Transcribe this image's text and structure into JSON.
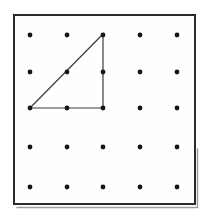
{
  "figure": {
    "type": "geoboard-diagram",
    "background_color": "#ffffff",
    "board": {
      "x": 14,
      "y": 15,
      "width": 181,
      "height": 189,
      "fill": "#fefefe",
      "border_color": "#2b2b2b",
      "border_width": 2,
      "shadow_color": "#9e9e9e",
      "shadow_width": 1.5
    },
    "grid": {
      "rows": 5,
      "cols": 5,
      "col_x": [
        30,
        67,
        103,
        140,
        177
      ],
      "row_y": [
        35,
        72,
        108,
        147,
        187
      ],
      "dot_radius": 2.4,
      "dot_color": "#161616"
    },
    "triangle": {
      "shape": "right-triangle",
      "grid_positions": [
        {
          "col": 3,
          "row": 1
        },
        {
          "col": 1,
          "row": 3
        },
        {
          "col": 3,
          "row": 3
        }
      ],
      "vertices_px": [
        [
          103,
          34
        ],
        [
          30,
          108
        ],
        [
          103,
          108
        ]
      ],
      "stroke_color": "#3d3d3d",
      "stroke_width": 1.2,
      "fill": "none"
    }
  }
}
